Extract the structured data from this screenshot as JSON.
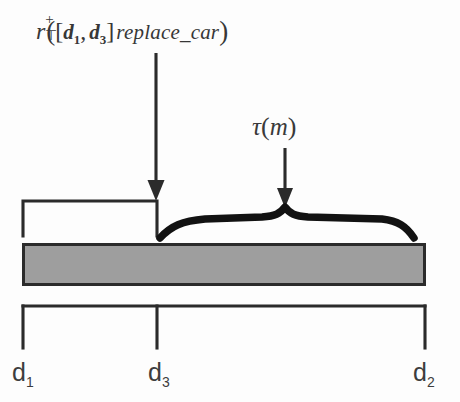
{
  "figure": {
    "background_color": "#fdfdfd",
    "stroke_color": "#2b2b2b",
    "bar_fill_color": "#9e9e9e",
    "bar_border_color": "#2b2b2b"
  },
  "annotations": {
    "formula": {
      "full_text": "r⁺_⊤([d₁, d₃]replace_car)",
      "base_symbol": "r",
      "superscript": "+",
      "subscript": "⊤",
      "open_paren": "(",
      "open_bracket": "[",
      "interval_start": "d",
      "interval_start_index": "1",
      "comma": ",",
      "interval_end": "d",
      "interval_end_index": "3",
      "close_bracket": "]",
      "action": "replace_car",
      "close_paren": ")"
    },
    "tau": {
      "full_text": "τ(m)",
      "symbol": "τ",
      "open_paren": "(",
      "argument": "m",
      "close_paren": ")"
    }
  },
  "axis": {
    "labels": [
      {
        "name": "d1",
        "base": "d",
        "index": "1",
        "position_x": 23
      },
      {
        "name": "d3",
        "base": "d",
        "index": "3",
        "position_x": 157
      },
      {
        "name": "d2",
        "base": "d",
        "index": "2",
        "position_x": 425
      }
    ]
  },
  "elements": {
    "left_bracket_name": "interval-bracket-d1-d3",
    "curly_brace_name": "curly-brace-tau-m",
    "gray_bar_name": "timeline-bar",
    "axis_scale_name": "axis-scale",
    "arrow_formula_name": "arrow-formula-to-bracket",
    "arrow_tau_name": "arrow-tau-to-brace"
  }
}
